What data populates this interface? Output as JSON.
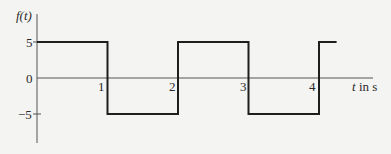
{
  "chart_data": {
    "type": "line",
    "title": "",
    "ylabel": "f(t)",
    "xlabel": "t in s",
    "x_ticks": [
      "1",
      "2",
      "3",
      "4"
    ],
    "y_ticks": [
      "5",
      "0",
      "−5"
    ],
    "xlim": [
      0,
      4.25
    ],
    "ylim": [
      -7,
      7
    ],
    "grid": false,
    "legend": null,
    "series": [
      {
        "name": "f(t)",
        "step": true,
        "x": [
          0,
          1,
          1,
          2,
          2,
          3,
          3,
          4,
          4,
          4.25
        ],
        "y": [
          5,
          5,
          -5,
          -5,
          5,
          5,
          -5,
          -5,
          5,
          5
        ]
      }
    ]
  },
  "labels": {
    "y_axis": "f(t)",
    "x_axis": "t in s",
    "tick_x_1": "1",
    "tick_x_2": "2",
    "tick_x_3": "3",
    "tick_x_4": "4",
    "tick_y_pos5": "5",
    "tick_y_0": "0",
    "tick_y_neg5": "−5"
  }
}
